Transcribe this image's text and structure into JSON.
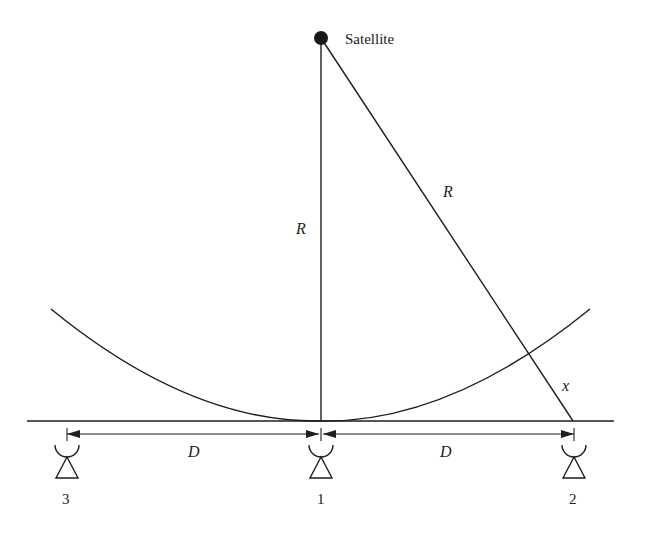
{
  "diagram": {
    "labels": {
      "satellite": "Satellite",
      "range_vertical": "R",
      "range_slant": "R",
      "difference": "x",
      "distance_left": "D",
      "distance_right": "D"
    },
    "stations": [
      {
        "id": "3",
        "label": "3",
        "icon": "antenna-dish-icon"
      },
      {
        "id": "1",
        "label": "1",
        "icon": "antenna-dish-icon"
      },
      {
        "id": "2",
        "label": "2",
        "icon": "antenna-dish-icon"
      }
    ],
    "colors": {
      "stroke": "#1e1e1e",
      "background": "#ffffff"
    }
  }
}
